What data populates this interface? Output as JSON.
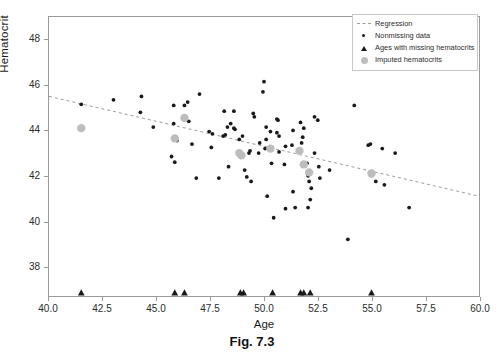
{
  "figure": {
    "caption": "Fig. 7.3"
  },
  "chart_data": {
    "type": "scatter",
    "title": "",
    "xlabel": "Age",
    "ylabel": "Hematocrit",
    "xlim": [
      40.0,
      60.0
    ],
    "ylim": [
      36.7,
      49.0
    ],
    "xticks": [
      40.0,
      42.5,
      45.0,
      47.5,
      50.0,
      52.5,
      55.0,
      57.5,
      60.0
    ],
    "xticklabels": [
      "40.0",
      "42.5",
      "45.0",
      "47.5",
      "50.0",
      "52.5",
      "55.0",
      "57.5",
      "60.0"
    ],
    "yticks": [
      38,
      40,
      42,
      44,
      46,
      48
    ],
    "yticklabels": [
      "38",
      "40",
      "42",
      "44",
      "46",
      "48"
    ],
    "grid": false,
    "legend_position": "top-right",
    "legend": [
      {
        "label": "Regression",
        "marker": "dashed-line",
        "color": "#9b9b9b"
      },
      {
        "label": "Nonmissing data",
        "marker": "small-dot",
        "color": "#1a1a1a"
      },
      {
        "label": "Ages with missing hematocrits",
        "marker": "triangle",
        "color": "#1a1a1a"
      },
      {
        "label": "Imputed hematocrits",
        "marker": "large-circle",
        "color": "#bdbdbd"
      }
    ],
    "series": [
      {
        "name": "Nonmissing data",
        "marker": "small-dot",
        "color": "#1a1a1a",
        "points": [
          [
            41.5,
            45.15
          ],
          [
            43.0,
            45.35
          ],
          [
            44.25,
            44.8
          ],
          [
            44.3,
            45.5
          ],
          [
            44.85,
            44.15
          ],
          [
            45.8,
            45.1
          ],
          [
            45.8,
            44.3
          ],
          [
            46.3,
            45.1
          ],
          [
            46.45,
            45.25
          ],
          [
            46.5,
            44.4
          ],
          [
            45.95,
            43.55
          ],
          [
            45.7,
            42.85
          ],
          [
            45.85,
            42.6
          ],
          [
            46.65,
            43.4
          ],
          [
            47.0,
            45.6
          ],
          [
            46.85,
            41.9
          ],
          [
            47.45,
            43.95
          ],
          [
            47.6,
            43.85
          ],
          [
            47.55,
            43.25
          ],
          [
            47.9,
            41.9
          ],
          [
            48.15,
            44.85
          ],
          [
            48.1,
            43.75
          ],
          [
            48.2,
            43.8
          ],
          [
            48.3,
            44.15
          ],
          [
            48.35,
            42.4
          ],
          [
            48.6,
            44.85
          ],
          [
            48.6,
            44.1
          ],
          [
            48.65,
            44.05
          ],
          [
            48.95,
            42.9
          ],
          [
            49.1,
            42.25
          ],
          [
            49.3,
            43.0
          ],
          [
            49.35,
            43.1
          ],
          [
            49.5,
            44.75
          ],
          [
            49.55,
            44.6
          ],
          [
            49.4,
            41.75
          ],
          [
            49.2,
            41.95
          ],
          [
            49.75,
            43.0
          ],
          [
            49.8,
            43.45
          ],
          [
            50.0,
            46.15
          ],
          [
            49.95,
            45.7
          ],
          [
            50.1,
            44.15
          ],
          [
            50.1,
            43.6
          ],
          [
            50.3,
            43.95
          ],
          [
            50.35,
            42.55
          ],
          [
            50.15,
            41.1
          ],
          [
            50.45,
            40.15
          ],
          [
            50.6,
            44.5
          ],
          [
            50.65,
            44.45
          ],
          [
            50.6,
            43.9
          ],
          [
            50.7,
            43.75
          ],
          [
            50.7,
            43.05
          ],
          [
            50.95,
            42.5
          ],
          [
            51.0,
            40.55
          ],
          [
            51.35,
            44.0
          ],
          [
            51.3,
            43.35
          ],
          [
            51.35,
            41.3
          ],
          [
            51.45,
            40.6
          ],
          [
            51.7,
            44.35
          ],
          [
            51.75,
            43.45
          ],
          [
            51.8,
            43.7
          ],
          [
            51.85,
            44.1
          ],
          [
            52.0,
            42.55
          ],
          [
            52.05,
            42.0
          ],
          [
            52.1,
            41.75
          ],
          [
            52.2,
            41.45
          ],
          [
            52.15,
            40.95
          ],
          [
            52.05,
            40.6
          ],
          [
            52.35,
            44.6
          ],
          [
            52.35,
            43.0
          ],
          [
            52.5,
            44.45
          ],
          [
            52.55,
            42.4
          ],
          [
            52.6,
            41.9
          ],
          [
            53.05,
            42.25
          ],
          [
            53.9,
            39.2
          ],
          [
            54.2,
            45.1
          ],
          [
            54.85,
            43.35
          ],
          [
            54.95,
            43.4
          ],
          [
            55.2,
            41.75
          ],
          [
            55.5,
            43.2
          ],
          [
            55.6,
            41.6
          ],
          [
            56.1,
            43.0
          ],
          [
            56.75,
            40.6
          ],
          [
            48.45,
            44.3
          ],
          [
            49.0,
            43.75
          ],
          [
            50.05,
            43.2
          ],
          [
            51.0,
            43.3
          ],
          [
            48.85,
            43.6
          ]
        ]
      },
      {
        "name": "Imputed hematocrits",
        "marker": "large-circle",
        "color": "#bdbdbd",
        "points": [
          [
            41.5,
            44.1
          ],
          [
            45.85,
            43.65
          ],
          [
            46.3,
            44.55
          ],
          [
            48.85,
            43.0
          ],
          [
            48.95,
            42.9
          ],
          [
            50.3,
            43.2
          ],
          [
            51.65,
            43.1
          ],
          [
            51.85,
            42.5
          ],
          [
            52.1,
            42.15
          ],
          [
            55.0,
            42.1
          ]
        ]
      },
      {
        "name": "Ages with missing hematocrits",
        "marker": "triangle",
        "color": "#1a1a1a",
        "rug_y": 36.85,
        "ages": [
          41.5,
          45.85,
          46.3,
          48.9,
          49.05,
          50.4,
          51.7,
          51.85,
          52.15,
          55.0
        ]
      }
    ],
    "regression": {
      "label": "Regression",
      "style": "dashed",
      "color": "#9b9b9b",
      "x": [
        40.0,
        60.0
      ],
      "y": [
        45.5,
        41.1
      ]
    }
  }
}
